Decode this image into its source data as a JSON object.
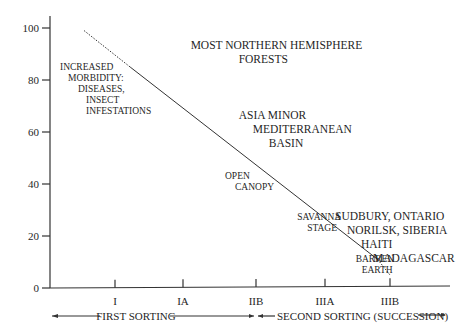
{
  "chart_data": {
    "type": "line",
    "title": "",
    "xlabel": "",
    "ylabel": "",
    "ylim": [
      0,
      100
    ],
    "y_ticks": [
      0,
      20,
      40,
      60,
      80,
      100
    ],
    "x_categories": [
      "I",
      "IA",
      "IIB",
      "IIIA",
      "IIIB"
    ],
    "series": [
      {
        "name": "trend",
        "points": [
          {
            "x": -0.45,
            "y": 99,
            "style": "dashed"
          },
          {
            "x": 0.22,
            "y": 85,
            "style": "solid"
          },
          {
            "x": 3.82,
            "y": 11,
            "style": "dashed"
          },
          {
            "x": 4.0,
            "y": 5,
            "style": "end"
          }
        ]
      }
    ],
    "annotations": [
      {
        "id": "most-northern",
        "lines": [
          "MOST NORTHERN HEMISPHERE",
          "FORESTS"
        ],
        "x": 1.1,
        "y": 92,
        "size": "big"
      },
      {
        "id": "increased-morbidity",
        "lines": [
          "INCREASED",
          "MORBIDITY:",
          "DISEASES,",
          "INSECT",
          "INFESTATIONS"
        ],
        "x": -0.8,
        "y": 84,
        "size": "small"
      },
      {
        "id": "asia-minor",
        "lines": [
          "ASIA MINOR",
          "MEDITERRANEAN",
          "BASIN"
        ],
        "x": 1.8,
        "y": 65,
        "size": "big"
      },
      {
        "id": "open-canopy",
        "lines": [
          "OPEN",
          "CANOPY"
        ],
        "x": 1.6,
        "y": 42,
        "size": "small"
      },
      {
        "id": "savanna-stage",
        "lines": [
          "SAVANNA",
          "STAGE"
        ],
        "x": 2.65,
        "y": 26,
        "size": "small"
      },
      {
        "id": "sudbury",
        "lines": [
          "SUDBURY, ONTARIO",
          "NORILSK, SIBERIA",
          "HAITI",
          "MADAGASCAR"
        ],
        "x": 3.2,
        "y": 26,
        "size": "big"
      },
      {
        "id": "barren-earth",
        "lines": [
          "BARREN",
          "EARTH"
        ],
        "x": 3.5,
        "y": 10,
        "size": "small"
      }
    ],
    "sorting_labels": {
      "first": "FIRST SORTING",
      "second": "SECOND SORTING (SUCCESSION)"
    },
    "grid": false,
    "legend": "none"
  }
}
